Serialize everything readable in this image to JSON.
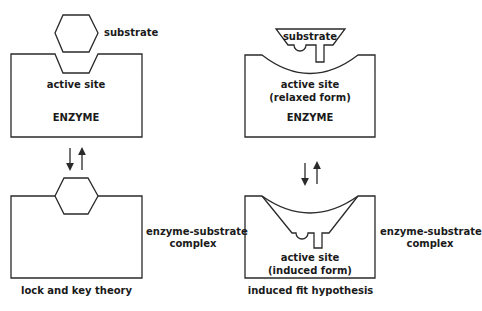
{
  "panels": {
    "lock_and_key": {
      "title": "lock and key theory",
      "substrate_label": "substrate",
      "active_site_label": "active site",
      "enzyme_label": "ENZYME",
      "complex_label_line1": "enzyme-substrate",
      "complex_label_line2": "complex"
    },
    "induced_fit": {
      "title": "induced fit hypothesis",
      "substrate_label": "substrate",
      "active_site_label_line1": "active site",
      "active_site_label_line2": "(relaxed form)",
      "enzyme_label": "ENZYME",
      "induced_site_line1": "active site",
      "induced_site_line2": "(induced form)",
      "complex_label_line1": "enzyme-substrate",
      "complex_label_line2": "complex"
    }
  },
  "colors": {
    "stroke": "#2a2a2a",
    "text": "#1a1a1a",
    "background": "#ffffff"
  }
}
